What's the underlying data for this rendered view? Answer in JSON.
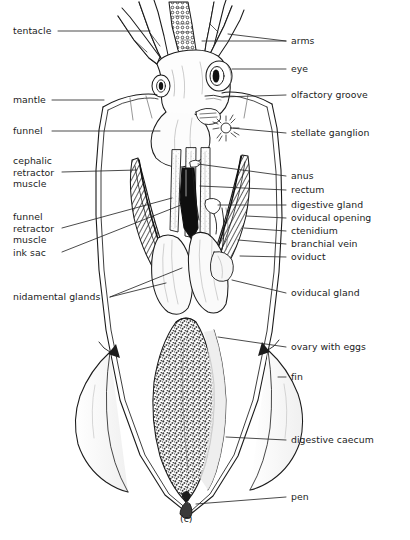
{
  "figure": {
    "caption": "(c)",
    "colors": {
      "background": "#ffffff",
      "ink": "#1b1b1b",
      "leader": "#2a2a2a",
      "organ_fill": "#fbfbfb",
      "shade": "#d8d8d8"
    }
  },
  "labels": {
    "left": [
      {
        "id": "tentacle",
        "text": "tentacle",
        "lines": [
          "tentacle"
        ]
      },
      {
        "id": "mantle",
        "text": "mantle",
        "lines": [
          "mantle"
        ]
      },
      {
        "id": "funnel",
        "text": "funnel",
        "lines": [
          "funnel"
        ]
      },
      {
        "id": "cephalic-retractor-muscle",
        "text": "cephalic retractor muscle",
        "lines": [
          "cephalic",
          "retractor",
          "muscle"
        ]
      },
      {
        "id": "funnel-retractor-muscle",
        "text": "funnel retractor muscle",
        "lines": [
          "funnel",
          "retractor",
          "muscle"
        ]
      },
      {
        "id": "ink-sac",
        "text": "ink sac",
        "lines": [
          "ink sac"
        ]
      },
      {
        "id": "nidamental-glands",
        "text": "nidamental glands",
        "lines": [
          "nidamental glands"
        ]
      }
    ],
    "right": [
      {
        "id": "arms",
        "text": "arms"
      },
      {
        "id": "eye",
        "text": "eye"
      },
      {
        "id": "olfactory-groove",
        "text": "olfactory groove"
      },
      {
        "id": "stellate-ganglion",
        "text": "stellate ganglion"
      },
      {
        "id": "anus",
        "text": "anus"
      },
      {
        "id": "rectum",
        "text": "rectum"
      },
      {
        "id": "digestive-gland",
        "text": "digestive gland"
      },
      {
        "id": "oviducal-opening",
        "text": "oviducal opening"
      },
      {
        "id": "ctenidium",
        "text": "ctenidium"
      },
      {
        "id": "branchial-vein",
        "text": "branchial vein"
      },
      {
        "id": "oviduct",
        "text": "oviduct"
      },
      {
        "id": "oviducal-gland",
        "text": "oviducal gland"
      },
      {
        "id": "ovary-with-eggs",
        "text": "ovary with eggs"
      },
      {
        "id": "fin",
        "text": "fin"
      },
      {
        "id": "digestive-caecum",
        "text": "digestive caecum"
      },
      {
        "id": "pen",
        "text": "pen"
      }
    ]
  }
}
